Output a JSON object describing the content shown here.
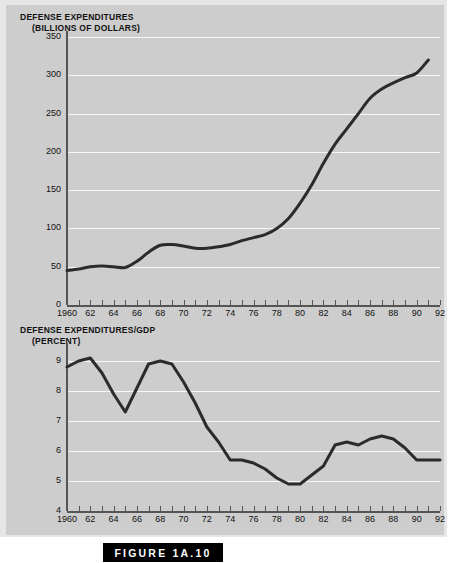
{
  "figure": {
    "caption": "FIGURE 1A.10"
  },
  "chart_data": [
    {
      "type": "line",
      "id": "defense-expenditures",
      "title": "DEFENSE EXPENDITURES",
      "subtitle": "(BILLIONS OF DOLLARS)",
      "xlabel": "",
      "ylabel": "Billions of dollars",
      "ylim": [
        0,
        350
      ],
      "yticks": [
        0,
        50,
        100,
        150,
        200,
        250,
        300,
        350
      ],
      "ytick_labels": [
        "0",
        "50",
        "100",
        "150",
        "200",
        "250",
        "300",
        "350"
      ],
      "xlim": [
        1960,
        1992
      ],
      "xticks": [
        1960,
        1961,
        1962,
        1963,
        1964,
        1965,
        1966,
        1967,
        1968,
        1969,
        1970,
        1971,
        1972,
        1973,
        1974,
        1975,
        1976,
        1977,
        1978,
        1979,
        1980,
        1981,
        1982,
        1983,
        1984,
        1985,
        1986,
        1987,
        1988,
        1989,
        1990,
        1991,
        1992
      ],
      "xtick_labels": [
        "1960",
        "",
        "62",
        "",
        "64",
        "",
        "66",
        "",
        "68",
        "",
        "70",
        "",
        "72",
        "",
        "74",
        "",
        "76",
        "",
        "78",
        "",
        "80",
        "",
        "82",
        "",
        "84",
        "",
        "86",
        "",
        "88",
        "",
        "90",
        "",
        "92"
      ],
      "grid": true,
      "legend": "none",
      "x": [
        1960,
        1961,
        1962,
        1963,
        1964,
        1965,
        1966,
        1967,
        1968,
        1969,
        1970,
        1971,
        1972,
        1973,
        1974,
        1975,
        1976,
        1977,
        1978,
        1979,
        1980,
        1981,
        1982,
        1983,
        1984,
        1985,
        1986,
        1987,
        1988,
        1989,
        1990,
        1991
      ],
      "values": [
        45,
        47,
        50,
        51,
        50,
        49,
        57,
        69,
        78,
        79,
        77,
        74,
        74,
        76,
        79,
        84,
        88,
        92,
        100,
        113,
        133,
        157,
        185,
        210,
        230,
        250,
        270,
        282,
        290,
        297,
        303,
        320
      ]
    },
    {
      "type": "line",
      "id": "defense-expenditures-gdp",
      "title": "DEFENSE EXPENDITURES/GDP",
      "subtitle": "(PERCENT)",
      "xlabel": "",
      "ylabel": "Percent",
      "ylim": [
        4,
        9.4
      ],
      "yticks": [
        4,
        5,
        6,
        7,
        8,
        9
      ],
      "ytick_labels": [
        "4",
        "5",
        "6",
        "7",
        "8",
        "9"
      ],
      "xlim": [
        1960,
        1992
      ],
      "xticks": [
        1960,
        1961,
        1962,
        1963,
        1964,
        1965,
        1966,
        1967,
        1968,
        1969,
        1970,
        1971,
        1972,
        1973,
        1974,
        1975,
        1976,
        1977,
        1978,
        1979,
        1980,
        1981,
        1982,
        1983,
        1984,
        1985,
        1986,
        1987,
        1988,
        1989,
        1990,
        1991,
        1992
      ],
      "xtick_labels": [
        "1960",
        "",
        "62",
        "",
        "64",
        "",
        "66",
        "",
        "68",
        "",
        "70",
        "",
        "72",
        "",
        "74",
        "",
        "76",
        "",
        "78",
        "",
        "80",
        "",
        "82",
        "",
        "84",
        "",
        "86",
        "",
        "88",
        "",
        "90",
        "",
        "92"
      ],
      "grid": true,
      "legend": "none",
      "x": [
        1960,
        1961,
        1962,
        1963,
        1964,
        1965,
        1966,
        1967,
        1968,
        1969,
        1970,
        1971,
        1972,
        1973,
        1974,
        1975,
        1976,
        1977,
        1978,
        1979,
        1980,
        1981,
        1982,
        1983,
        1984,
        1985,
        1986,
        1987,
        1988,
        1989,
        1990,
        1991,
        1992
      ],
      "values": [
        8.8,
        9.0,
        9.1,
        8.6,
        7.9,
        7.3,
        8.1,
        8.9,
        9.0,
        8.9,
        8.3,
        7.6,
        6.8,
        6.3,
        5.7,
        5.7,
        5.6,
        5.4,
        5.1,
        4.9,
        4.9,
        5.2,
        5.5,
        6.2,
        6.3,
        6.2,
        6.4,
        6.5,
        6.4,
        6.1,
        5.7,
        5.7,
        5.7
      ]
    }
  ],
  "colors": {
    "panel": "#cdcdcd",
    "frame": "#e6e6e6",
    "gridline": "#f7f7f7",
    "axis": "#555555",
    "series": "#2b2b2b",
    "caption_bg": "#000000",
    "caption_text": "#ffffff"
  }
}
